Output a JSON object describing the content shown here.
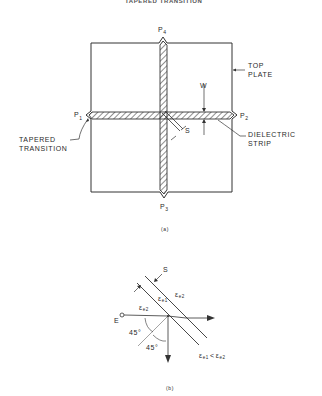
{
  "header": {
    "text": "TAPERED TRANSITION"
  },
  "figure_a": {
    "caption": "(a)",
    "ports": {
      "p1": "P",
      "p1_sub": "1",
      "p2": "P",
      "p2_sub": "2",
      "p3": "P",
      "p3_sub": "3",
      "p4": "P",
      "p4_sub": "4"
    },
    "labels": {
      "top_plate_line1": "TOP",
      "top_plate_line2": "PLATE",
      "dielectric_line1": "DIELECTRIC",
      "dielectric_line2": "STRIP",
      "tapered_line1": "TAPERED",
      "tapered_line2": "TRANSITION",
      "width": "W",
      "spacing": "S"
    }
  },
  "figure_b": {
    "caption": "(b)",
    "labels": {
      "spacing": "S",
      "field": "E",
      "angle1": "45°",
      "angle2": "45°",
      "eps_e1": "ε",
      "eps_e1_sub": "e1",
      "eps_e2_left": "ε",
      "eps_e2_left_sub": "e2",
      "eps_e2_right": "ε",
      "eps_e2_right_sub": "e2",
      "relation": "ε",
      "relation_sub1": "e1",
      "relation_op": "<",
      "relation_eps2": "ε",
      "relation_sub2": "e2"
    }
  }
}
